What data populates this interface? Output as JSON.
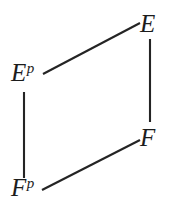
{
  "figure": {
    "kind": "commutative-diagram",
    "shape": "parallelogram",
    "background_color": "#ffffff",
    "ink_color": "#242424"
  },
  "nodes": {
    "top_right": {
      "base": "E",
      "sup": "",
      "name": "E"
    },
    "top_left": {
      "base": "E",
      "sup": "p",
      "name": "E^p"
    },
    "bottom_right": {
      "base": "F",
      "sup": "",
      "name": "F"
    },
    "bottom_left": {
      "base": "F",
      "sup": "p",
      "name": "F^p"
    }
  },
  "edges": [
    {
      "id": "ep-to-e",
      "from": "E^p",
      "to": "E",
      "orientation": "diagonal",
      "x1": 43,
      "y1": 74,
      "x2": 140,
      "y2": 23
    },
    {
      "id": "e-to-f",
      "from": "E",
      "to": "F",
      "orientation": "vertical",
      "x1": 150,
      "y1": 39,
      "x2": 150,
      "y2": 122
    },
    {
      "id": "ep-to-fp",
      "from": "E^p",
      "to": "F^p",
      "orientation": "vertical",
      "x1": 24,
      "y1": 92,
      "x2": 24,
      "y2": 178
    },
    {
      "id": "fp-to-f",
      "from": "F^p",
      "to": "F",
      "orientation": "diagonal",
      "x1": 42,
      "y1": 190,
      "x2": 140,
      "y2": 140
    }
  ]
}
